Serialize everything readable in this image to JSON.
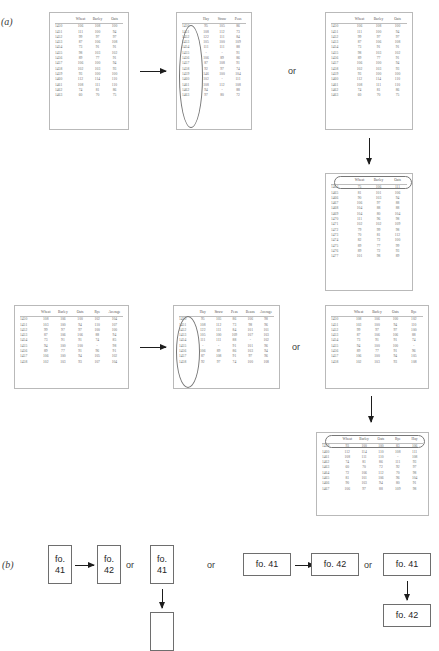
{
  "figure": {
    "part_a_label": "(a)",
    "part_b_label": "(b)",
    "or_label": "or"
  },
  "tables": {
    "a1": {
      "name": "wheat-barley-oats-source",
      "columns": [
        "",
        "Wheat",
        "Barley",
        "Oats"
      ],
      "rows": [
        [
          "1450",
          "106",
          "108",
          "100"
        ],
        [
          "1451",
          "111",
          "100",
          "94"
        ],
        [
          "1452",
          "99",
          "97",
          "97"
        ],
        [
          "1453",
          "87",
          "106",
          "108"
        ],
        [
          "1454",
          "73",
          "91",
          "91"
        ],
        [
          "1455",
          "98",
          "103",
          "102"
        ],
        [
          "1456",
          "89",
          "77",
          "91"
        ],
        [
          "1457",
          "106",
          "100",
          "94"
        ],
        [
          "1458",
          "102",
          "103",
          "93"
        ],
        [
          "1459",
          "93",
          "100",
          "100"
        ],
        [
          "1460",
          "112",
          "114",
          "110"
        ],
        [
          "1461",
          "108",
          "111",
          "110"
        ],
        [
          "1462",
          "74",
          "81",
          "86"
        ],
        [
          "1463",
          "60",
          "70",
          "75"
        ]
      ]
    },
    "a2": {
      "name": "hay-straw-peas-source",
      "columns": [
        "",
        "Hay",
        "Straw",
        "Peas"
      ],
      "rows": [
        [
          "1450",
          "95",
          "105",
          "86"
        ],
        [
          "1451",
          "108",
          "112",
          "73"
        ],
        [
          "1452",
          "122",
          "111",
          "84"
        ],
        [
          "1453",
          "105",
          "100",
          "109"
        ],
        [
          "1454",
          "111",
          "111",
          "88"
        ],
        [
          "1455",
          "-",
          "-",
          "91"
        ],
        [
          "1456",
          "106",
          "89",
          "86"
        ],
        [
          "1457",
          "87",
          "108",
          "91"
        ],
        [
          "1458",
          "92",
          "97",
          "74"
        ],
        [
          "1459",
          "146",
          "100",
          "104"
        ],
        [
          "1460",
          "102",
          "-",
          "111"
        ],
        [
          "1461",
          "108",
          "112",
          "108"
        ],
        [
          "1462",
          "94",
          "-",
          "88"
        ],
        [
          "1463",
          "97",
          "80",
          "72"
        ]
      ]
    },
    "a3": {
      "name": "wheat-barley-oats-alt",
      "columns": [
        "",
        "Wheat",
        "Barley",
        "Oats"
      ],
      "rows": [
        [
          "1450",
          "106",
          "108",
          "100"
        ],
        [
          "1451",
          "111",
          "100",
          "94"
        ],
        [
          "1452",
          "99",
          "97",
          "97"
        ],
        [
          "1453",
          "87",
          "106",
          "108"
        ],
        [
          "1454",
          "73",
          "91",
          "91"
        ],
        [
          "1455",
          "98",
          "103",
          "102"
        ],
        [
          "1456",
          "89",
          "77",
          "91"
        ],
        [
          "1457",
          "106",
          "100",
          "94"
        ],
        [
          "1458",
          "102",
          "103",
          "93"
        ],
        [
          "1459",
          "93",
          "100",
          "100"
        ],
        [
          "1460",
          "112",
          "114",
          "110"
        ],
        [
          "1461",
          "108",
          "111",
          "110"
        ],
        [
          "1462",
          "74",
          "81",
          "86"
        ],
        [
          "1463",
          "60",
          "70",
          "75"
        ]
      ]
    },
    "a4": {
      "name": "wheat-barley-oats-later",
      "columns": [
        "",
        "Wheat",
        "Barley",
        "Oats"
      ],
      "rows": [
        [
          "1464",
          "75",
          "106",
          "111"
        ],
        [
          "1465",
          "81",
          "101",
          "106"
        ],
        [
          "1466",
          "90",
          "103",
          "94"
        ],
        [
          "1467",
          "106",
          "97",
          "88"
        ],
        [
          "1468",
          "104",
          "88",
          "88"
        ],
        [
          "1469",
          "104",
          "80",
          "104"
        ],
        [
          "1470",
          "111",
          "96",
          "98"
        ],
        [
          "1471",
          "102",
          "102",
          "109"
        ],
        [
          "1472",
          "79",
          "99",
          "98"
        ],
        [
          "1473",
          "70",
          "81",
          "112"
        ],
        [
          "1474",
          "82",
          "72",
          "100"
        ],
        [
          "1475",
          "89",
          "77",
          "99"
        ],
        [
          "1476",
          "89",
          "72",
          "93"
        ],
        [
          "1477",
          "101",
          "98",
          "89"
        ]
      ]
    },
    "b1": {
      "name": "wheat-barley-oats-rye-average",
      "columns": [
        "",
        "Wheat",
        "Barley",
        "Oats",
        "Rye",
        "Average"
      ],
      "rows": [
        [
          "1450",
          "108",
          "106",
          "100",
          "102",
          "104"
        ],
        [
          "1451",
          "103",
          "100",
          "94",
          "110",
          "107"
        ],
        [
          "1452",
          "99",
          "97",
          "97",
          "100",
          "100"
        ],
        [
          "1453",
          "87",
          "106",
          "106",
          "88",
          "94"
        ],
        [
          "1454",
          "73",
          "91",
          "91",
          "74",
          "85"
        ],
        [
          "1455",
          "94",
          "100",
          "100",
          "-",
          "98"
        ],
        [
          "1456",
          "89",
          "77",
          "91",
          "96",
          "91"
        ],
        [
          "1457",
          "106",
          "100",
          "94",
          "105",
          "102"
        ],
        [
          "1458",
          "102",
          "103",
          "93",
          "107",
          "104"
        ]
      ]
    },
    "b2": {
      "name": "hay-straw-peas-beans-average",
      "columns": [
        "",
        "Hay",
        "Straw",
        "Peas",
        "Beans",
        "Average"
      ],
      "rows": [
        [
          "1450",
          "95",
          "105",
          "86",
          "106",
          "98"
        ],
        [
          "1451",
          "108",
          "112",
          "73",
          "98",
          "96"
        ],
        [
          "1452",
          "122",
          "111",
          "84",
          "101",
          "101"
        ],
        [
          "1453",
          "105",
          "100",
          "109",
          "107",
          "103"
        ],
        [
          "1454",
          "111",
          "111",
          "88",
          "-",
          "102"
        ],
        [
          "1455",
          "-",
          "-",
          "91",
          "101",
          "96"
        ],
        [
          "1456",
          "106",
          "89",
          "86",
          "103",
          "94"
        ],
        [
          "1457",
          "87",
          "108",
          "91",
          "97",
          "96"
        ],
        [
          "1458",
          "92",
          "97",
          "74",
          "100",
          "108"
        ]
      ]
    },
    "b3": {
      "name": "wheat-barley-oats-rye-alt",
      "columns": [
        "",
        "Wheat",
        "Barley",
        "Oats",
        "Rye"
      ],
      "rows": [
        [
          "1450",
          "108",
          "106",
          "100",
          "102"
        ],
        [
          "1451",
          "103",
          "100",
          "94",
          "110"
        ],
        [
          "1452",
          "99",
          "97",
          "97",
          "100"
        ],
        [
          "1453",
          "87",
          "106",
          "106",
          "88"
        ],
        [
          "1454",
          "73",
          "91",
          "91",
          "74"
        ],
        [
          "1455",
          "94",
          "100",
          "100",
          "-"
        ],
        [
          "1456",
          "89",
          "77",
          "91",
          "96"
        ],
        [
          "1457",
          "106",
          "100",
          "94",
          "105"
        ],
        [
          "1458",
          "102",
          "103",
          "93",
          "108"
        ]
      ]
    },
    "b4": {
      "name": "wheat-barley-oats-rye-hay",
      "columns": [
        "",
        "Wheat",
        "Barley",
        "Oats",
        "Rye",
        "Hay"
      ],
      "rows": [
        [
          "1459",
          "93",
          "100",
          "100",
          "83",
          "106"
        ],
        [
          "1460",
          "112",
          "114",
          "110",
          "108",
          "111"
        ],
        [
          "1461",
          "108",
          "111",
          "110",
          "-",
          "108"
        ],
        [
          "1462",
          "74",
          "81",
          "86",
          "111",
          "93"
        ],
        [
          "1463",
          "60",
          "70",
          "72",
          "92",
          "97"
        ],
        [
          "1464",
          "72",
          "106",
          "112",
          "70",
          "98"
        ],
        [
          "1465",
          "81",
          "101",
          "106",
          "96",
          "104"
        ],
        [
          "1466",
          "90",
          "103",
          "94",
          "80",
          "91"
        ],
        [
          "1467",
          "106",
          "97",
          "88",
          "109",
          "98"
        ]
      ]
    }
  },
  "folio_boxes": {
    "b_left_1": "fo.\n41",
    "b_left_2": "fo.\n42",
    "b_left_3": "fo.\n41",
    "b_left_4": "",
    "b_right_1": "fo. 41",
    "b_right_2": "fo. 42",
    "b_right_3": "fo. 41",
    "b_right_4": "fo. 42"
  }
}
